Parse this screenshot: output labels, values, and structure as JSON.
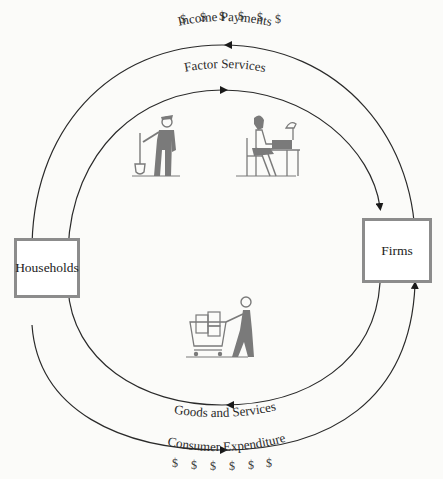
{
  "diagram": {
    "type": "circular-flow",
    "nodes": {
      "households": "Households",
      "firms": "Firms"
    },
    "flows": {
      "income_payments": "Income Payments",
      "factor_services": "Factor Services",
      "goods_and_services": "Goods and Services",
      "consumer_expenditure": "Consumer Expenditure"
    },
    "symbols": {
      "dollar": "$"
    },
    "illustrations": [
      "worker-with-shovel",
      "office-worker-at-desk",
      "shopper-with-cart"
    ],
    "colors": {
      "line": "#2a2a2a",
      "box_border": "#8c8c8c",
      "figure": "#7a7a7a",
      "background": "#fbfbf9"
    }
  }
}
